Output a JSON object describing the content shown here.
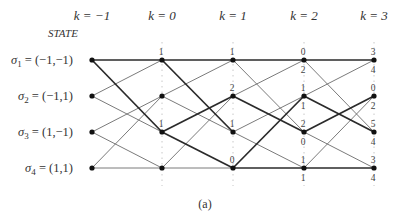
{
  "diagram": {
    "type": "trellis",
    "header": {
      "state_title": "STATE",
      "time_labels": [
        "k = −1",
        "k = 0",
        "k = 1",
        "k = 2",
        "k = 3"
      ]
    },
    "states": [
      {
        "id": "s1",
        "label": "σ1 = (−1,−1)",
        "sym": "σ",
        "sub": "1",
        "value": " = (−1,−1)"
      },
      {
        "id": "s2",
        "label": "σ2 = (−1,1)",
        "sym": "σ",
        "sub": "2",
        "value": " = (−1,1)"
      },
      {
        "id": "s3",
        "label": "σ3 = (1,−1)",
        "sym": "σ",
        "sub": "3",
        "value": " = (1,−1)"
      },
      {
        "id": "s4",
        "label": "σ4 = (1,1)",
        "sym": "σ",
        "sub": "4",
        "value": " = (1,1)"
      }
    ],
    "caption": "(a)",
    "stages": [
      {
        "from_k": -1,
        "to_k": 0,
        "edges": [
          {
            "from": 1,
            "to": 1,
            "bold": true
          },
          {
            "from": 1,
            "to": 3,
            "bold": true
          },
          {
            "from": 2,
            "to": 1,
            "bold": false
          },
          {
            "from": 2,
            "to": 3,
            "bold": false
          },
          {
            "from": 3,
            "to": 2,
            "bold": false
          },
          {
            "from": 3,
            "to": 4,
            "bold": false
          },
          {
            "from": 4,
            "to": 2,
            "bold": false
          },
          {
            "from": 4,
            "to": 4,
            "bold": false
          }
        ]
      },
      {
        "from_k": 0,
        "to_k": 1,
        "edges": [
          {
            "from": 1,
            "to": 1,
            "bold": true
          },
          {
            "from": 1,
            "to": 3,
            "bold": true
          },
          {
            "from": 2,
            "to": 1,
            "bold": false
          },
          {
            "from": 2,
            "to": 3,
            "bold": false
          },
          {
            "from": 3,
            "to": 2,
            "bold": true
          },
          {
            "from": 3,
            "to": 4,
            "bold": true
          },
          {
            "from": 4,
            "to": 2,
            "bold": false
          },
          {
            "from": 4,
            "to": 4,
            "bold": false
          }
        ]
      },
      {
        "from_k": 1,
        "to_k": 2,
        "edges": [
          {
            "from": 1,
            "to": 1,
            "bold": true
          },
          {
            "from": 1,
            "to": 3,
            "bold": false
          },
          {
            "from": 2,
            "to": 1,
            "bold": false
          },
          {
            "from": 2,
            "to": 3,
            "bold": true
          },
          {
            "from": 3,
            "to": 2,
            "bold": false
          },
          {
            "from": 3,
            "to": 4,
            "bold": false
          },
          {
            "from": 4,
            "to": 2,
            "bold": true
          },
          {
            "from": 4,
            "to": 4,
            "bold": true
          }
        ]
      },
      {
        "from_k": 2,
        "to_k": 3,
        "edges": [
          {
            "from": 1,
            "to": 1,
            "bold": true
          },
          {
            "from": 1,
            "to": 3,
            "bold": false
          },
          {
            "from": 2,
            "to": 1,
            "bold": false
          },
          {
            "from": 2,
            "to": 3,
            "bold": true
          },
          {
            "from": 3,
            "to": 2,
            "bold": true
          },
          {
            "from": 3,
            "to": 4,
            "bold": false
          },
          {
            "from": 4,
            "to": 2,
            "bold": false
          },
          {
            "from": 4,
            "to": 4,
            "bold": true
          }
        ]
      }
    ],
    "node_metrics": [
      {
        "k": 0,
        "state": 1,
        "above": "1",
        "below": ""
      },
      {
        "k": 0,
        "state": 3,
        "above": "1",
        "below": ""
      },
      {
        "k": 1,
        "state": 1,
        "above": "1",
        "below": ""
      },
      {
        "k": 1,
        "state": 2,
        "above": "2",
        "below": ""
      },
      {
        "k": 1,
        "state": 3,
        "above": "1",
        "below": ""
      },
      {
        "k": 1,
        "state": 4,
        "above": "0",
        "below": ""
      },
      {
        "k": 2,
        "state": 1,
        "above": "0",
        "below": "2"
      },
      {
        "k": 2,
        "state": 2,
        "above": "1",
        "below": "1"
      },
      {
        "k": 2,
        "state": 3,
        "above": "2",
        "below": "0"
      },
      {
        "k": 2,
        "state": 4,
        "above": "1",
        "below": "1"
      },
      {
        "k": 3,
        "state": 1,
        "above": "3",
        "below": "4"
      },
      {
        "k": 3,
        "state": 2,
        "above": "0",
        "below": "2"
      },
      {
        "k": 3,
        "state": 3,
        "above": "5",
        "below": "4"
      },
      {
        "k": 3,
        "state": 4,
        "above": "3",
        "below": "4"
      }
    ],
    "colors": {
      "thin_edge": "#6b6b6b",
      "bold_edge": "#2a2a2a",
      "node": "#111111",
      "guide": "#c8c8c8"
    }
  }
}
